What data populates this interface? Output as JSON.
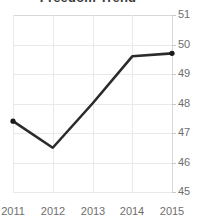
{
  "chart_data": {
    "type": "line",
    "title": "Freedom Trend",
    "xlabel": "",
    "ylabel": "",
    "categories": [
      "2011",
      "2012",
      "2013",
      "2014",
      "2015"
    ],
    "x": [
      2011,
      2012,
      2013,
      2014,
      2015
    ],
    "values": [
      47.4,
      46.5,
      48.0,
      49.6,
      49.7
    ],
    "series": [
      {
        "name": "Score",
        "values": [
          47.4,
          46.5,
          48.0,
          49.6,
          49.7
        ]
      }
    ],
    "ylim": [
      45,
      51
    ],
    "yticks": [
      45,
      46,
      47,
      48,
      49,
      50,
      51
    ],
    "ytick_labels": [
      "45",
      "46",
      "47",
      "48",
      "49",
      "50",
      "51"
    ],
    "xtick_labels": [
      "2011",
      "2012",
      "2013",
      "2014",
      "2015"
    ],
    "grid": true,
    "legend": false,
    "legend_position": "none",
    "marker": "circle",
    "line_color": "#2b2b2b",
    "marker_color": "#1a1a1a",
    "grid_color": "#e9e9e9",
    "axis_color": "#d8d8d8",
    "tick_label_color": "#6e6e6e",
    "title_color": "#3b3b3b",
    "background_color": "#ffffff"
  }
}
